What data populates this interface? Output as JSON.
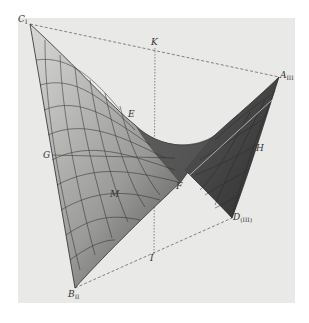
{
  "figure": {
    "colors": {
      "background": "#ffffff",
      "plate": "#e9e9e7",
      "surface_light": "#c8c8c6",
      "surface_dark": "#3a3a3a",
      "lines": "#2a2a2a"
    },
    "points": {
      "C": {
        "label": "C",
        "sub": "I",
        "x": 30,
        "y": 24
      },
      "A": {
        "label": "A",
        "sub": "III",
        "x": 279,
        "y": 77
      },
      "D": {
        "label": "D",
        "sub": "(III)",
        "x": 232,
        "y": 218
      },
      "B": {
        "label": "B",
        "sub": "II",
        "x": 75,
        "y": 288
      },
      "K": {
        "label": "K",
        "x": 155,
        "y": 48
      },
      "I": {
        "label": "I",
        "x": 154,
        "y": 254
      },
      "E": {
        "label": "E",
        "x": 132,
        "y": 113
      },
      "F": {
        "label": "F",
        "x": 180,
        "y": 183
      },
      "G": {
        "label": "G",
        "x": 50,
        "y": 155
      },
      "H": {
        "label": "H",
        "x": 260,
        "y": 148
      },
      "M": {
        "label": "M",
        "x": 113,
        "y": 195
      }
    }
  }
}
